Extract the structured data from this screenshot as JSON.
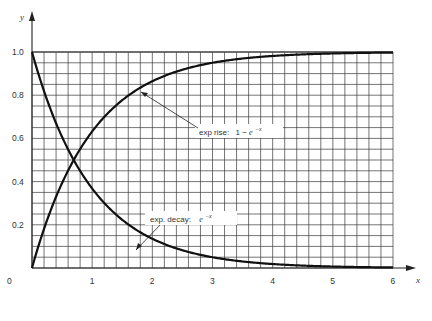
{
  "chart_data": {
    "type": "line",
    "title": "",
    "xlabel": "x",
    "ylabel": "y",
    "xlim": [
      0,
      6
    ],
    "ylim": [
      0,
      1.0
    ],
    "grid": true,
    "grid_x_step": 0.2,
    "grid_y_step": 0.05,
    "x_ticks": [
      "0",
      "1",
      "2",
      "3",
      "4",
      "5",
      "6"
    ],
    "y_ticks": [
      "0.2",
      "0.4",
      "0.6",
      "0.8",
      "1.0"
    ],
    "origin_label": "0",
    "series": [
      {
        "name": "exp rise: 1 − e^−x",
        "x": [
          0,
          0.5,
          1,
          1.5,
          2,
          2.5,
          3,
          3.5,
          4,
          4.5,
          5,
          5.5,
          6
        ],
        "values": [
          0,
          0.39,
          0.63,
          0.78,
          0.86,
          0.92,
          0.95,
          0.97,
          0.98,
          0.99,
          0.99,
          1.0,
          1.0
        ]
      },
      {
        "name": "exp. decay: e^−x",
        "x": [
          0,
          0.5,
          1,
          1.5,
          2,
          2.5,
          3,
          3.5,
          4,
          4.5,
          5,
          5.5,
          6
        ],
        "values": [
          1.0,
          0.61,
          0.37,
          0.22,
          0.14,
          0.08,
          0.05,
          0.03,
          0.02,
          0.01,
          0.01,
          0.0,
          0.0
        ]
      }
    ],
    "annotations": [
      {
        "text": "exp rise:",
        "formula_prefix": "1 − ",
        "formula_base": "e",
        "formula_exp": "−x",
        "points_to_x": 1.75
      },
      {
        "text": "exp. decay:",
        "formula_prefix": "",
        "formula_base": "e",
        "formula_exp": "−x",
        "points_to_x": 1.75
      }
    ],
    "legend": "none (inline annotations)"
  }
}
